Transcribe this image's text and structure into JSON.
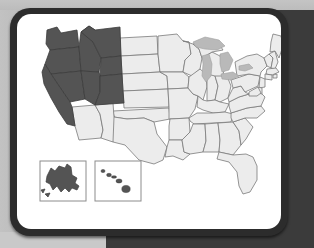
{
  "panel": {
    "title": "United States choropleth map",
    "frame_color": "#2c2c2c",
    "panel_color": "#ffffff",
    "backdrop_dark": "#3b3b3b",
    "backdrop_light": "#bdbdbd"
  },
  "map": {
    "name": "us-states-map",
    "projection": "albers-usa",
    "highlight_color": "#545454",
    "base_color": "#ececec",
    "border_color": "#7a7a7a",
    "lake_color": "#b9b9b9",
    "insets": [
      {
        "id": "alaska-inset",
        "label": "Alaska",
        "highlighted": true
      },
      {
        "id": "hawaii-inset",
        "label": "Hawaii",
        "highlighted": true
      }
    ],
    "highlighted_states": [
      "Washington",
      "Oregon",
      "California",
      "Nevada",
      "Idaho",
      "Montana",
      "Wyoming",
      "Utah",
      "Colorado",
      "Alaska",
      "Hawaii"
    ],
    "base_states": [
      "Arizona",
      "New Mexico",
      "Texas",
      "Oklahoma",
      "Kansas",
      "Nebraska",
      "South Dakota",
      "North Dakota",
      "Minnesota",
      "Iowa",
      "Missouri",
      "Arkansas",
      "Louisiana",
      "Mississippi",
      "Alabama",
      "Tennessee",
      "Kentucky",
      "Illinois",
      "Wisconsin",
      "Michigan",
      "Indiana",
      "Ohio",
      "West Virginia",
      "Virginia",
      "North Carolina",
      "South Carolina",
      "Georgia",
      "Florida",
      "Pennsylvania",
      "New York",
      "Maine",
      "Vermont",
      "New Hampshire",
      "Massachusetts",
      "Rhode Island",
      "Connecticut",
      "New Jersey",
      "Delaware",
      "Maryland"
    ],
    "lakes": [
      "Lake Superior",
      "Lake Michigan",
      "Lake Huron",
      "Lake Erie",
      "Lake Ontario"
    ]
  }
}
